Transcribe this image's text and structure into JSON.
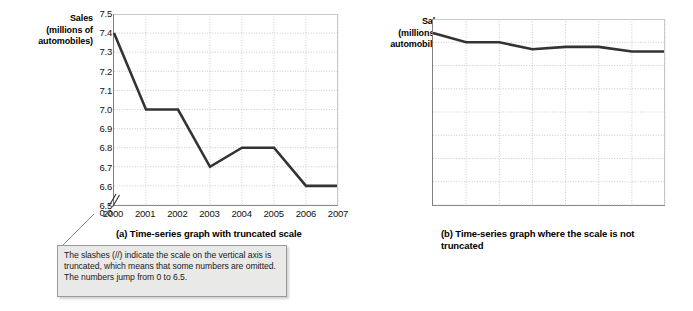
{
  "figure": {
    "axis_title_line1": "Sales",
    "axis_title_line2": "(millions of",
    "axis_title_line3": "automobiles)",
    "callout_text": "The slashes (//) indicate the scale on the vertical axis is truncated, which means that some numbers are omitted.  The numbers jump from 0 to 6.5.",
    "callout_bg": "#e9e9e7",
    "line_color": "#333333",
    "grid_color": "#bdbdbd",
    "axis_color": "#808080"
  },
  "chart_data": [
    {
      "type": "line",
      "id": "a",
      "title": "(a) Time-series graph with truncated scale",
      "xlabel": "",
      "ylabel": "Sales (millions of automobiles)",
      "categories": [
        "2000",
        "2001",
        "2002",
        "2003",
        "2004",
        "2005",
        "2006",
        "2007"
      ],
      "values": [
        7.4,
        7.0,
        7.0,
        6.7,
        6.8,
        6.8,
        6.6,
        6.6
      ],
      "ytick_labels": [
        "7.5",
        "7.4",
        "7.3",
        "7.2",
        "7.1",
        "7.0",
        "6.9",
        "6.8",
        "6.7",
        "6.6",
        "6.5",
        "0.0"
      ],
      "ytick_values": [
        7.5,
        7.4,
        7.3,
        7.2,
        7.1,
        7.0,
        6.9,
        6.8,
        6.7,
        6.6,
        6.5,
        0.0
      ],
      "ylim": [
        6.5,
        7.5
      ],
      "axis_truncated": true,
      "truncation_break": "0.0 to 6.5",
      "grid": true,
      "legend": "none"
    },
    {
      "type": "line",
      "id": "b",
      "title": "(b) Time-series graph where the scale is not truncated",
      "xlabel": "",
      "ylabel": "Sales (millions of automobiles)",
      "categories": [
        "2000",
        "2001",
        "2002",
        "2003",
        "2004",
        "2005",
        "2006",
        "2007"
      ],
      "values": [
        7.4,
        7.0,
        7.0,
        6.7,
        6.8,
        6.8,
        6.6,
        6.6
      ],
      "ytick_labels": [
        "8.0",
        "7.0",
        "6.0",
        "5.0",
        "4.0",
        "3.0",
        "2.0",
        "1.0",
        "0.0"
      ],
      "ytick_values": [
        8.0,
        7.0,
        6.0,
        5.0,
        4.0,
        3.0,
        2.0,
        1.0,
        0.0
      ],
      "ylim": [
        0.0,
        8.0
      ],
      "axis_truncated": false,
      "grid": true,
      "legend": "none"
    }
  ]
}
